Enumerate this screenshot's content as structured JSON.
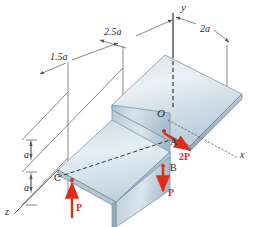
{
  "figure": {
    "kind": "engineering-statics-diagram",
    "colors": {
      "plate_light": "#e9f0f5",
      "plate_mid": "#c2d2de",
      "plate_dark": "#9fb4c4",
      "edge_stroke": "#6d8496",
      "dimension_line": "#555555",
      "force_red": "#e02b1c",
      "text": "#2b2b2b",
      "background": "#ffffff"
    }
  },
  "axes": [
    {
      "name": "y-axis",
      "label": "y",
      "x": 183,
      "y": 5
    },
    {
      "name": "x-axis",
      "label": "x",
      "x": 241,
      "y": 155
    },
    {
      "name": "z-axis",
      "label": "z",
      "x": 7,
      "y": 210
    }
  ],
  "dimensions": [
    {
      "name": "dim-1p5a",
      "label": "1.5a",
      "x": 54,
      "y": 58
    },
    {
      "name": "dim-2p5a",
      "label": "2.5a",
      "x": 108,
      "y": 33
    },
    {
      "name": "dim-2a",
      "label": "2a",
      "x": 202,
      "y": 30
    },
    {
      "name": "dim-a-upper",
      "label": "a",
      "x": 27,
      "y": 150
    },
    {
      "name": "dim-a-lower",
      "label": "a",
      "x": 27,
      "y": 183
    }
  ],
  "points": [
    {
      "name": "point-O",
      "label": "O",
      "x": 160,
      "y": 114
    },
    {
      "name": "point-A",
      "label": "A",
      "x": 172,
      "y": 142
    },
    {
      "name": "point-B",
      "label": "B",
      "x": 172,
      "y": 168
    },
    {
      "name": "point-C",
      "label": "C",
      "x": 58,
      "y": 178
    }
  ],
  "forces": [
    {
      "name": "force-2P",
      "label": "2P",
      "x": 178,
      "y": 156,
      "direction": "along +x",
      "applied_at": "A"
    },
    {
      "name": "force-P-down",
      "label": "P",
      "x": 168,
      "y": 192,
      "direction": "-y (downward)",
      "applied_at": "B"
    },
    {
      "name": "force-P-up",
      "label": "P",
      "x": 78,
      "y": 207,
      "direction": "+y (upward)",
      "applied_at": "C"
    }
  ]
}
